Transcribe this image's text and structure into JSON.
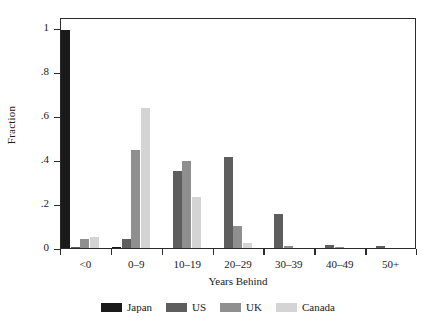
{
  "chart_data": {
    "type": "bar",
    "title": "",
    "xlabel": "Years Behind",
    "ylabel": "Fraction",
    "categories": [
      "<0",
      "0–9",
      "10–19",
      "20–29",
      "30–39",
      "40–49",
      "50+"
    ],
    "series": [
      {
        "name": "Japan",
        "color": "#1a1a1a",
        "values": [
          0.99,
          0.005,
          0.0,
          0.0,
          0.0,
          0.0,
          0.0
        ]
      },
      {
        "name": "US",
        "color": "#5e5e5e",
        "values": [
          0.002,
          0.04,
          0.35,
          0.415,
          0.155,
          0.012,
          0.01
        ]
      },
      {
        "name": "UK",
        "color": "#8f8f8f",
        "values": [
          0.04,
          0.445,
          0.395,
          0.1,
          0.009,
          0.004,
          0.0
        ]
      },
      {
        "name": "Canada",
        "color": "#d4d4d4",
        "values": [
          0.05,
          0.635,
          0.23,
          0.025,
          0.0,
          0.0,
          0.0
        ]
      }
    ],
    "ylim": [
      0,
      1.05
    ],
    "yticks": [
      0,
      0.2,
      0.4,
      0.6,
      0.8,
      1
    ],
    "ytick_labels": [
      "0",
      ".2",
      ".4",
      ".6",
      ".8",
      "1"
    ],
    "grid": false,
    "legend_position": "bottom",
    "frame": "box"
  }
}
